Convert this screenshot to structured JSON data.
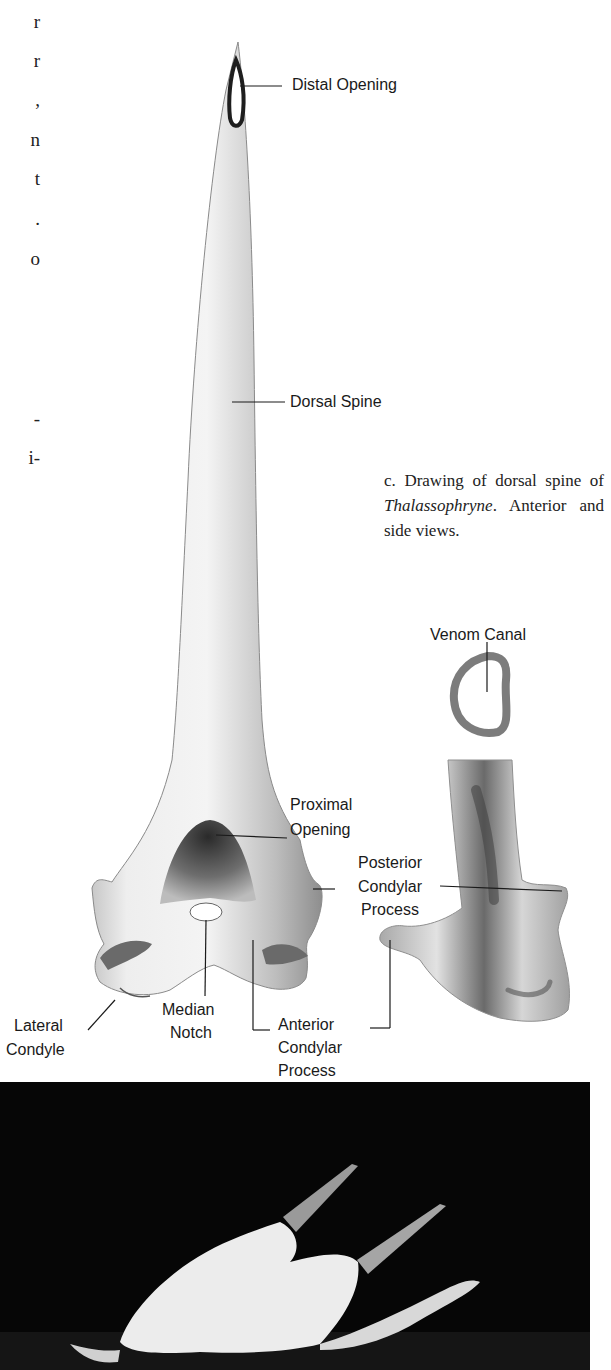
{
  "previous_column": {
    "line_endings": [
      "r",
      "r",
      ",",
      "n",
      "t",
      ".",
      "o",
      "",
      "",
      "",
      "-",
      "i-"
    ]
  },
  "figure": {
    "caption": {
      "letter": "c.",
      "text_before": "Drawing of dorsal spine of ",
      "genus": "Thalassophryne",
      "text_after": ". Anterior and side views."
    },
    "labels": {
      "distal_opening": "Distal Opening",
      "dorsal_spine": "Dorsal Spine",
      "venom_canal": "Venom Canal",
      "proximal_opening_1": "Proximal",
      "proximal_opening_2": "Opening",
      "posterior_condylar_1": "Posterior",
      "posterior_condylar_2": "Condylar",
      "posterior_condylar_3": "Process",
      "lateral_condyle_1": "Lateral",
      "lateral_condyle_2": "Condyle",
      "median_notch_1": "Median",
      "median_notch_2": "Notch",
      "anterior_condylar_1": "Anterior",
      "anterior_condylar_2": "Condylar",
      "anterior_condylar_3": "Process"
    },
    "views": [
      "anterior view",
      "side view",
      "cross-section"
    ]
  },
  "photo": {
    "description": "Photograph of dissected dorsal spines with venom glands on dark background"
  }
}
